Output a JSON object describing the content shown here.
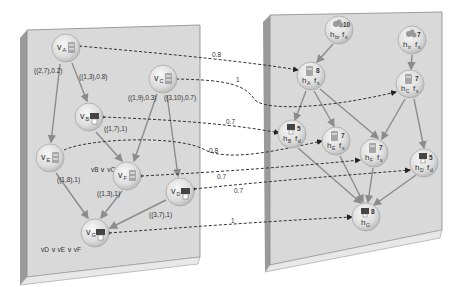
{
  "left_panel": {
    "name": "task-graph",
    "nodes": [
      {
        "id": "A",
        "label": "v",
        "sub": "A",
        "x": 66,
        "y": 48,
        "icon": "database"
      },
      {
        "id": "B",
        "label": "v",
        "sub": "B",
        "x": 89,
        "y": 117,
        "icon": "gpu"
      },
      {
        "id": "C",
        "label": "v",
        "sub": "C",
        "x": 163,
        "y": 79,
        "icon": "database"
      },
      {
        "id": "E",
        "label": "v",
        "sub": "E",
        "x": 50,
        "y": 158,
        "icon": "database"
      },
      {
        "id": "F",
        "label": "v",
        "sub": "F",
        "x": 127,
        "y": 176,
        "icon": "database"
      },
      {
        "id": "D",
        "label": "v",
        "sub": "D",
        "x": 180,
        "y": 192,
        "icon": "gpu"
      },
      {
        "id": "G",
        "label": "v",
        "sub": "G",
        "x": 95,
        "y": 233,
        "icon": "gpu"
      }
    ],
    "edge_labels": [
      {
        "text": "((2,7),0.2)",
        "x": 34,
        "y": 73
      },
      {
        "text": "((1,3),0.8)",
        "x": 79,
        "y": 79
      },
      {
        "text": "((1,9),0.3)",
        "x": 128,
        "y": 100
      },
      {
        "text": "((3,10),0.7)",
        "x": 164,
        "y": 100
      },
      {
        "text": "((1,7),1)",
        "x": 104,
        "y": 131
      },
      {
        "text": "((1,8),1)",
        "x": 57,
        "y": 182
      },
      {
        "text": "((1,3),1)",
        "x": 97,
        "y": 196
      },
      {
        "text": "((3,7),1)",
        "x": 149,
        "y": 217
      }
    ],
    "condition_labels": [
      {
        "text": "vB ∨ vC",
        "x": 91,
        "y": 172
      },
      {
        "text": "vD ∨ vE ∨ vF",
        "x": 41,
        "y": 252
      }
    ]
  },
  "right_panel": {
    "name": "resource-graph",
    "nodes": [
      {
        "id": "hbr",
        "label": "h",
        "sub": "br",
        "f": "f",
        "fsub": "s",
        "cost": "10",
        "x": 339,
        "y": 30,
        "icon": "cloud-servers"
      },
      {
        "id": "htr",
        "label": "h",
        "sub": "tr",
        "f": "f",
        "fsub": "s",
        "cost": "7",
        "x": 412,
        "y": 40,
        "icon": "cloud-servers"
      },
      {
        "id": "hA",
        "label": "h",
        "sub": "A",
        "f": "f",
        "fsub": "s",
        "cost": "8",
        "x": 311,
        "y": 76,
        "icon": "database"
      },
      {
        "id": "hC",
        "label": "h",
        "sub": "C",
        "f": "f",
        "fsub": "s",
        "cost": "7",
        "x": 410,
        "y": 84,
        "icon": "database"
      },
      {
        "id": "hB",
        "label": "h",
        "sub": "B",
        "f": "f",
        "fsub": "d",
        "cost": "5",
        "x": 292,
        "y": 134,
        "icon": "gpu"
      },
      {
        "id": "hE",
        "label": "h",
        "sub": "E",
        "f": "f",
        "fsub": "s",
        "cost": "7",
        "x": 336,
        "y": 141,
        "icon": "database"
      },
      {
        "id": "hF",
        "label": "h",
        "sub": "F",
        "f": "f",
        "fsub": "s",
        "cost": "7",
        "x": 374,
        "y": 153,
        "icon": "database"
      },
      {
        "id": "hD",
        "label": "h",
        "sub": "D",
        "f": "f",
        "fsub": "d",
        "cost": "5",
        "x": 424,
        "y": 163,
        "icon": "gpu"
      },
      {
        "id": "hG",
        "label": "h",
        "sub": "G",
        "f": "",
        "fsub": "",
        "cost": "8",
        "x": 366,
        "y": 217,
        "icon": "gpu"
      }
    ]
  },
  "mapping_labels": [
    {
      "text": "0.8",
      "x": 212,
      "y": 57
    },
    {
      "text": "1",
      "x": 236,
      "y": 82
    },
    {
      "text": "0.7",
      "x": 226,
      "y": 124
    },
    {
      "text": "0.8",
      "x": 209,
      "y": 153
    },
    {
      "text": "0.7",
      "x": 217,
      "y": 179
    },
    {
      "text": "0.7",
      "x": 234,
      "y": 193
    },
    {
      "text": "1",
      "x": 231,
      "y": 223
    }
  ],
  "colors": {
    "panel_face": "#d9d9d9",
    "panel_side": "#9a9a9a",
    "panel_edge": "#7f7f7f",
    "node_fill": "#e6e6e6",
    "edge": "#8c8c8c",
    "dashed": "#333333"
  }
}
